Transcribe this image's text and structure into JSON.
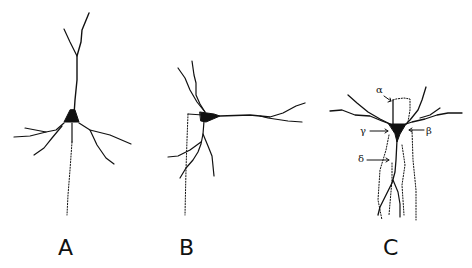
{
  "figure": {
    "panels": [
      {
        "id": "A",
        "label": "A",
        "description": "Neuron with apical dendrite, basal dendrites, dotted axon descending"
      },
      {
        "id": "B",
        "label": "B",
        "description": "Neuron with horizontal process, dotted axon from side branch"
      },
      {
        "id": "C",
        "label": "C",
        "description": "Neuron with multiple dendrites and labeled dotted paths"
      }
    ],
    "annotations": {
      "alpha": "α",
      "beta": "β",
      "gamma": "γ",
      "delta": "δ"
    },
    "colors": {
      "ink": "#111111",
      "background": "#ffffff"
    }
  }
}
